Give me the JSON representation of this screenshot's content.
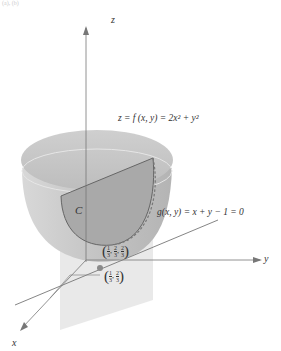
{
  "figure": {
    "top_fragment": "(a), (b)",
    "axes": {
      "z_label": "z",
      "y_label": "y",
      "x_label": "x"
    },
    "surface_label": "z = f (x, y) = 2x² + y²",
    "constraint_label": "g(x, y) = x + y − 1 = 0",
    "curve_label": "C",
    "point_3d": {
      "x_num": "1",
      "x_den": "3",
      "y_num": "2",
      "y_den": "3",
      "z_num": "2",
      "z_den": "3"
    },
    "point_2d": {
      "x_num": "1",
      "x_den": "3",
      "y_num": "2",
      "y_den": "3"
    },
    "colors": {
      "surface_outer": "#c9c9c9",
      "surface_rim": "#b8b8b8",
      "cut_face": "#a6a6a6",
      "plane": "#dcdcdc",
      "axis": "#555555",
      "point": "#8a8a8a"
    }
  }
}
